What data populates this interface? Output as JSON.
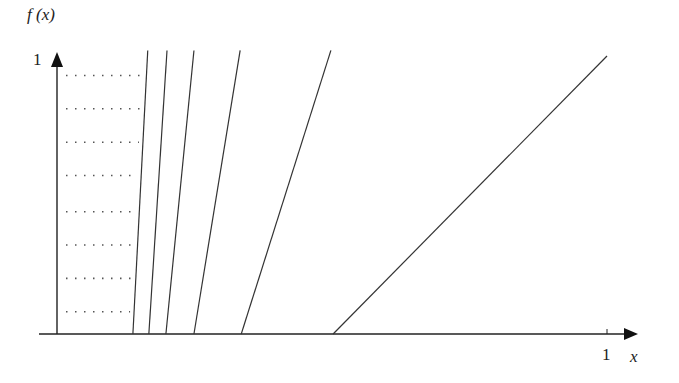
{
  "chart_data": {
    "type": "line",
    "title": "",
    "xlabel": "x",
    "ylabel": "f (x)",
    "xlim": [
      0,
      1
    ],
    "ylim": [
      0,
      1
    ],
    "x_ticks": [
      "1"
    ],
    "y_ticks": [
      "1"
    ],
    "grid": false,
    "legend": null,
    "series": [
      {
        "name": "line-1",
        "points": [
          [
            0.138,
            0
          ],
          [
            0.165,
            1.02
          ]
        ]
      },
      {
        "name": "line-2",
        "points": [
          [
            0.167,
            0
          ],
          [
            0.2,
            1.02
          ]
        ]
      },
      {
        "name": "line-3",
        "points": [
          [
            0.198,
            0
          ],
          [
            0.249,
            1.02
          ]
        ]
      },
      {
        "name": "line-4",
        "points": [
          [
            0.249,
            0
          ],
          [
            0.333,
            1.02
          ]
        ]
      },
      {
        "name": "line-5",
        "points": [
          [
            0.335,
            0
          ],
          [
            0.498,
            1.02
          ]
        ]
      },
      {
        "name": "line-6",
        "points": [
          [
            0.502,
            0
          ],
          [
            1.0,
            1.0
          ]
        ]
      }
    ],
    "dotted_levels": [
      0.93,
      0.81,
      0.69,
      0.57,
      0.44,
      0.32,
      0.2,
      0.08
    ],
    "annotations": "Horizontal dotted segments from the y-axis to the first line"
  },
  "labels": {
    "y_axis": "f (x)",
    "y_tick_one": "1",
    "x_tick_one": "1",
    "x_axis": "x"
  }
}
